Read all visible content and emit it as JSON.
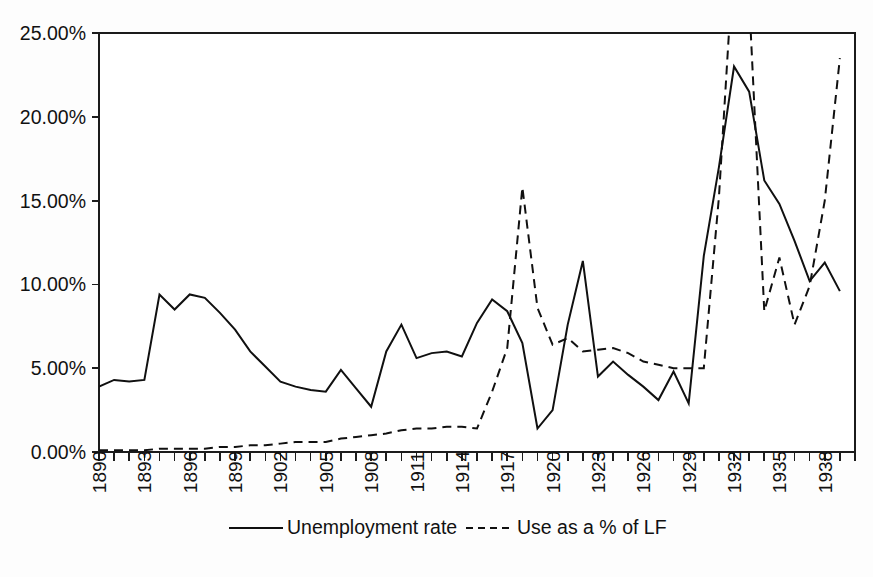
{
  "chart_data": {
    "type": "line",
    "title": "",
    "xlabel": "",
    "ylabel": "",
    "grid": false,
    "legend_position": "bottom",
    "xlim": [
      1890,
      1940
    ],
    "ylim": [
      0,
      25
    ],
    "ytick_labels": [
      "0.00%",
      "5.00%",
      "10.00%",
      "15.00%",
      "20.00%",
      "25.00%"
    ],
    "ytick_values": [
      0,
      5,
      10,
      15,
      20,
      25
    ],
    "xtick_labels": [
      "1890",
      "1893",
      "1896",
      "1899",
      "1902",
      "1905",
      "1908",
      "1911",
      "1914",
      "1917",
      "1920",
      "1923",
      "1926",
      "1929",
      "1932",
      "1935",
      "1938"
    ],
    "xtick_values": [
      1890,
      1893,
      1896,
      1899,
      1902,
      1905,
      1908,
      1911,
      1914,
      1917,
      1920,
      1923,
      1926,
      1929,
      1932,
      1935,
      1938
    ],
    "x": [
      1890,
      1891,
      1892,
      1893,
      1894,
      1895,
      1896,
      1897,
      1898,
      1899,
      1900,
      1901,
      1902,
      1903,
      1904,
      1905,
      1906,
      1907,
      1908,
      1909,
      1910,
      1911,
      1912,
      1913,
      1914,
      1915,
      1916,
      1917,
      1918,
      1919,
      1920,
      1921,
      1922,
      1923,
      1924,
      1925,
      1926,
      1927,
      1928,
      1929,
      1930,
      1931,
      1932,
      1933,
      1934,
      1935,
      1936,
      1937,
      1938,
      1939
    ],
    "series": [
      {
        "name": "Unemployment rate",
        "style": "solid",
        "values": [
          3.9,
          4.3,
          4.2,
          4.3,
          9.4,
          8.5,
          9.4,
          9.2,
          8.3,
          7.3,
          6.0,
          5.1,
          4.2,
          3.9,
          3.7,
          3.6,
          4.9,
          3.8,
          2.7,
          6.0,
          7.6,
          5.6,
          5.9,
          6.0,
          5.7,
          7.7,
          9.1,
          8.4,
          6.5,
          1.4,
          2.5,
          7.6,
          11.4,
          4.5,
          5.4,
          4.6,
          3.9,
          3.1,
          4.8,
          2.9,
          11.7,
          17.0,
          23.0,
          21.5,
          16.2,
          14.8,
          12.6,
          10.2,
          11.3,
          9.6
        ]
      },
      {
        "name": "Use as a % of LF",
        "style": "dashed",
        "values": [
          0.1,
          0.1,
          0.1,
          0.1,
          0.2,
          0.2,
          0.2,
          0.2,
          0.3,
          0.3,
          0.4,
          0.4,
          0.5,
          0.6,
          0.6,
          0.6,
          0.8,
          0.9,
          1.0,
          1.1,
          1.3,
          1.4,
          1.4,
          1.5,
          1.5,
          1.4,
          3.6,
          6.2,
          15.8,
          8.6,
          6.4,
          6.8,
          6.0,
          6.1,
          6.2,
          5.9,
          5.4,
          5.2,
          5.0,
          5.0,
          5.0,
          15.2,
          30.0,
          27.0,
          8.4,
          11.6,
          7.6,
          9.9,
          15.0,
          23.5
        ]
      }
    ],
    "legend": [
      {
        "label": "Unemployment rate",
        "style": "solid"
      },
      {
        "label": "Use as a % of LF",
        "style": "dashed"
      }
    ]
  },
  "colors": {
    "line": "#101010",
    "axis": "#1b1b1b",
    "background": "#fdfdfd",
    "text": "#111111"
  }
}
